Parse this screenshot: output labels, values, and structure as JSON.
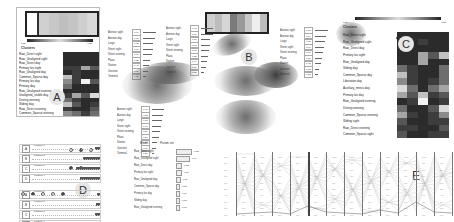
{
  "panels": {
    "A": {
      "letter": "A",
      "legend": {
        "low_label": "Low",
        "high_label": "High"
      },
      "header": "Clusters",
      "rows": [
        "Raw_Direct sight",
        "Raw_Unaligned sight",
        "Raw_Direct day",
        "Primary los sight",
        "Raw_Unaligned day",
        "Common_Sparse day",
        "Primary los day",
        "Primary day",
        "Raw_Unaligned evening",
        "Unaligned_visible day",
        "Driving evening",
        "Sliding day",
        "Raw_Direct evening",
        "Common_Sparse evening"
      ],
      "matrix": [
        [
          1,
          1,
          1,
          1
        ],
        [
          1,
          1,
          1,
          1
        ],
        [
          1,
          1,
          1,
          1
        ],
        [
          2,
          2,
          6,
          3
        ],
        [
          1,
          2,
          1,
          1
        ],
        [
          7,
          2,
          1,
          1
        ],
        [
          5,
          2,
          9,
          3
        ],
        [
          4,
          1,
          1,
          1
        ],
        [
          1,
          1,
          1,
          1
        ],
        [
          2,
          6,
          3,
          8
        ],
        [
          4,
          2,
          1,
          1
        ],
        [
          7,
          3,
          1,
          2
        ],
        [
          2,
          1,
          1,
          3
        ],
        [
          5,
          4,
          2,
          4
        ]
      ]
    },
    "B": {
      "letter": "B",
      "legend_left": {
        "labels": [
          "Avenue sight",
          "Avenue day",
          "Large",
          "Street sight",
          "Street evening",
          "Plaza",
          "Station",
          "Junction",
          "Terminal"
        ],
        "values": [
          "0.94",
          "0.88",
          "0.73",
          "0.71",
          "0.65",
          "0.52",
          "0.48",
          "0.39",
          "0.21"
        ]
      },
      "legend_mid": {
        "labels": [
          "Avenue sight",
          "Avenue day",
          "Large",
          "Street sight",
          "Street evening",
          "Plaza",
          "Station",
          "Junction",
          "Terminal"
        ],
        "values": [
          "0.91",
          "0.86",
          "0.70",
          "0.68",
          "0.61",
          "0.55",
          "0.44",
          "0.36",
          "0.25"
        ]
      },
      "legend_right": {
        "labels": [
          "Avenue sight",
          "Avenue day",
          "Large",
          "Street sight",
          "Street evening",
          "Plaza",
          "Station",
          "Junction",
          "Terminal"
        ],
        "values": [
          "0.93",
          "0.84",
          "0.75",
          "0.66",
          "0.60",
          "0.51",
          "0.42",
          "0.33",
          "0.22"
        ]
      },
      "legend_bottom": {
        "labels": [
          "Avenue sight",
          "Avenue day",
          "Large",
          "Street sight",
          "Street evening",
          "Plaza",
          "Station",
          "Junction",
          "Terminal"
        ],
        "values": [
          "0.90",
          "0.82",
          "0.72",
          "0.67",
          "0.59",
          "0.50",
          "0.41",
          "0.34",
          "0.20"
        ]
      },
      "strip_colors": [
        "#cfcfcf",
        "#bdbdbd",
        "#d6d6d6",
        "#7a7a7a",
        "#999",
        "#c8c8c8",
        "#eee",
        "#bdbdbd"
      ]
    },
    "C": {
      "letter": "C",
      "legend": {
        "low_label": "Low",
        "high_label": "High"
      },
      "header": "Clusters",
      "rows": [
        "Raw_Direct sight",
        "Raw_Unaligned sight",
        "Raw_Direct day",
        "Primary los sight",
        "Raw_Unaligned day",
        "Sliding day",
        "Common_Sparse day",
        "Liberation day",
        "Auxiliary_minus day",
        "Primary los day",
        "Raw_Unaligned evening",
        "Driving evening",
        "Common_Sparse evening",
        "Sliding sight",
        "Raw_Direct evening",
        "Common_Sparse sight"
      ],
      "matrix": [
        [
          1,
          1,
          1,
          1,
          1
        ],
        [
          1,
          1,
          2,
          1,
          1
        ],
        [
          1,
          1,
          1,
          1,
          1
        ],
        [
          1,
          1,
          6,
          3,
          7
        ],
        [
          1,
          1,
          6,
          1,
          1
        ],
        [
          4,
          2,
          1,
          1,
          4
        ],
        [
          7,
          2,
          1,
          1,
          4
        ],
        [
          5,
          2,
          1,
          2,
          4
        ],
        [
          8,
          4,
          1,
          4,
          6
        ],
        [
          6,
          3,
          7,
          2,
          3
        ],
        [
          1,
          2,
          9,
          1,
          2
        ],
        [
          4,
          1,
          1,
          3,
          8
        ],
        [
          6,
          2,
          1,
          2,
          5
        ],
        [
          3,
          1,
          1,
          2,
          2
        ],
        [
          2,
          2,
          1,
          1,
          3
        ],
        [
          3,
          1,
          1,
          2,
          2
        ]
      ]
    },
    "D": {
      "letter": "D",
      "group1": [
        {
          "tag": "A",
          "label": "Feature 1",
          "bar": 0.08
        },
        {
          "tag": "B",
          "label": "Feature 2",
          "bar": 0.25
        },
        {
          "tag": "C",
          "label": "Feature 3",
          "bar": 0.35
        },
        {
          "tag": "D",
          "label": "Feature 4",
          "bar": 0.3
        }
      ],
      "group2": [
        {
          "tag": "A",
          "label": "Feature 1",
          "bar": 0.05
        },
        {
          "tag": "B",
          "label": "Feature 2",
          "bar": 0.06
        },
        {
          "tag": "C",
          "label": "Feature 3",
          "bar": 0.07
        },
        {
          "tag": "D",
          "label": "Feature 4",
          "bar": 0.18
        }
      ]
    },
    "E": {
      "letter": "E",
      "axes_count": 13,
      "legend_left": "Model",
      "legend_right": "Param set",
      "ticks": [
        "1000",
        "900",
        "800",
        "700",
        "600",
        "500",
        "400",
        "300",
        "200",
        "100"
      ]
    },
    "hist": {
      "rows": [
        {
          "label": "Raw_Direct sight",
          "value": "0.82"
        },
        {
          "label": "Raw_Unaligned sight",
          "value": "0.74"
        },
        {
          "label": "Raw_Direct day",
          "value": "0.33"
        },
        {
          "label": "Primary los sight",
          "value": "0.29"
        },
        {
          "label": "Raw_Unaligned day",
          "value": "0.24"
        },
        {
          "label": "Common_Sparse day",
          "value": "0.13"
        },
        {
          "label": "Primary los day",
          "value": "0.17"
        },
        {
          "label": "Sliding day",
          "value": "0.12"
        },
        {
          "label": "Raw_Unaligned evening",
          "value": "0.10"
        }
      ],
      "widths": [
        14,
        12,
        4,
        4,
        3,
        2,
        2,
        2,
        2
      ]
    }
  },
  "colors": {
    "heat_scale": [
      "#1b1b1b",
      "#2b2b2b",
      "#3d3d3d",
      "#575757",
      "#6e6e6e",
      "#8a8a8a",
      "#a5a5a5",
      "#c0c0c0",
      "#dadada",
      "#f2f2f2"
    ],
    "panel_letter_bg": "#e6e6e6"
  }
}
